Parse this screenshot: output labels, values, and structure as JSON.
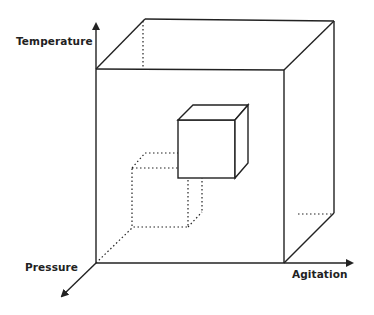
{
  "axes": {
    "vertical": {
      "label": "Temperature"
    },
    "horizontal": {
      "label": "Agitation"
    },
    "depth": {
      "label": "Pressure"
    }
  },
  "figure": {
    "line_color": "#222222",
    "outer_cube": {
      "front": {
        "x1": 96,
        "y1": 69,
        "x2": 284,
        "y2": 263
      },
      "back": {
        "x1": 145,
        "y1": 19,
        "x2": 334,
        "y2": 213
      }
    },
    "inner_solid_cube": {
      "front": {
        "x1": 178,
        "y1": 120,
        "x2": 235,
        "y2": 178
      },
      "back": {
        "x1": 193,
        "y1": 105,
        "x2": 248,
        "y2": 163
      }
    },
    "inner_dotted_cube": {
      "front": {
        "x1": 132,
        "y1": 168,
        "x2": 188,
        "y2": 227
      },
      "back": {
        "x1": 145,
        "y1": 153,
        "x2": 202,
        "y2": 212
      }
    }
  }
}
